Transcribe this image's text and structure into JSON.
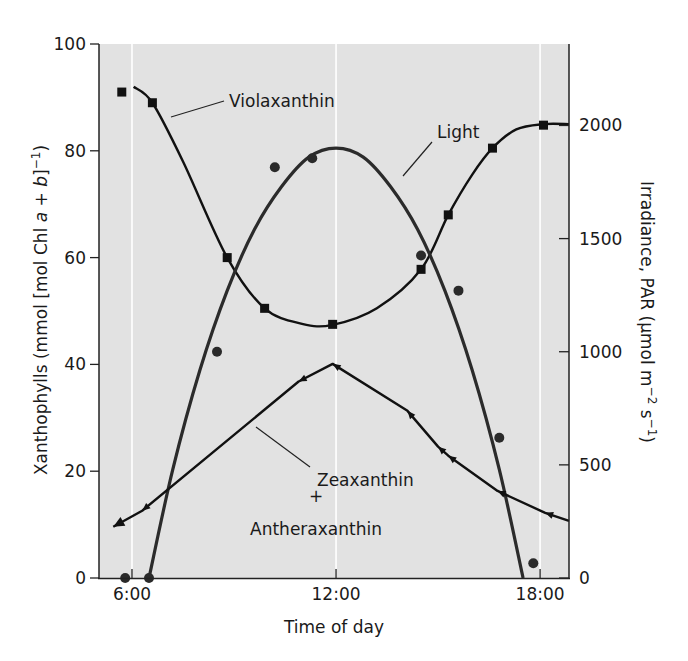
{
  "chart_data": {
    "type": "line",
    "title": "",
    "xlabel": "Time of day",
    "ylabel_left": "Xanthophylls (mmol [mol Chl a + b]⁻¹)",
    "ylabel_left_parts": [
      "Xanthophylls (mmol [mol Chl ",
      "a",
      " + ",
      "b",
      "]",
      "−1",
      ")"
    ],
    "ylabel_right": "Irradiance, PAR (µmol m⁻² s⁻¹)",
    "ylabel_right_parts": [
      "Irradiance, PAR (µmol m",
      "−2",
      " s",
      "−1",
      ")"
    ],
    "x_unit": "hours",
    "xlim": [
      5.03,
      18.85
    ],
    "ylim_left": [
      0,
      100
    ],
    "ylim_right": [
      0,
      2360
    ],
    "x_ticks": [
      6,
      12,
      18
    ],
    "x_tick_labels": [
      "6:00",
      "12:00",
      "18:00"
    ],
    "y_left_ticks": [
      0,
      20,
      40,
      60,
      80,
      100
    ],
    "y_left_tick_labels": [
      "0",
      "20",
      "40",
      "60",
      "80",
      "100"
    ],
    "y_right_ticks": [
      0,
      500,
      1000,
      1500,
      2000
    ],
    "y_right_tick_labels": [
      "0",
      "500",
      "1000",
      "1500",
      "2000"
    ],
    "grid": "vertical white lines at 6:00, 12:00, 18:00",
    "background": "#e2e2e2",
    "series": [
      {
        "name": "Violaxanthin",
        "axis": "left",
        "marker": "square",
        "x": [
          5.7,
          6.6,
          8.8,
          9.9,
          11.9,
          14.5,
          15.3,
          16.6,
          18.1
        ],
        "y": [
          91,
          89,
          60,
          50.5,
          47.5,
          57.8,
          68,
          80.5,
          84.8
        ],
        "curve_x": [
          6.05,
          6.6,
          7.5,
          8.8,
          9.9,
          11.0,
          11.9,
          13.2,
          14.5,
          15.3,
          16.0,
          16.6,
          17.3,
          18.1,
          18.85
        ],
        "curve_y": [
          92,
          89,
          78,
          60,
          50.5,
          47.6,
          47.4,
          50.5,
          57.8,
          68,
          75.5,
          80.5,
          84,
          85,
          85
        ]
      },
      {
        "name": "Light",
        "axis": "right",
        "marker": "circle",
        "x": [
          5.8,
          6.5,
          8.5,
          10.2,
          11.3,
          14.5,
          15.6,
          16.8,
          17.8
        ],
        "y": [
          0,
          0,
          1000,
          1815,
          1855,
          1425,
          1270,
          620,
          65
        ],
        "curve_x": [
          6.5,
          7.2,
          8.0,
          8.8,
          9.6,
          10.4,
          11.2,
          12.0,
          12.8,
          13.6,
          14.4,
          15.2,
          16.0,
          16.8,
          17.5
        ],
        "curve_y": [
          0,
          480,
          920,
          1270,
          1540,
          1730,
          1860,
          1900,
          1860,
          1730,
          1540,
          1270,
          920,
          480,
          0
        ]
      },
      {
        "name": "Zeaxanthin + Antheraxanthin",
        "axis": "left",
        "marker": "triangle",
        "x": [
          5.45,
          6.3,
          10.9,
          11.9,
          14.1,
          15.0,
          15.3,
          16.75,
          18.15
        ],
        "y": [
          9.6,
          12.6,
          36.8,
          40.1,
          31.3,
          24.6,
          22.9,
          16.3,
          12.2
        ],
        "curve_x": [
          5.45,
          6.3,
          10.9,
          11.9,
          14.1,
          15.0,
          15.3,
          16.75,
          18.15,
          18.85
        ],
        "curve_y": [
          9.6,
          12.6,
          36.8,
          40.1,
          31.3,
          24.6,
          22.9,
          16.3,
          12.2,
          10.7
        ]
      }
    ],
    "annotations": [
      {
        "text": "Violaxanthin",
        "series": "Violaxanthin"
      },
      {
        "text": "Light",
        "series": "Light"
      },
      {
        "text_lines": [
          "Zeaxanthin",
          "+",
          "Antheraxanthin"
        ],
        "series": "Zeaxanthin + Antheraxanthin"
      }
    ]
  }
}
